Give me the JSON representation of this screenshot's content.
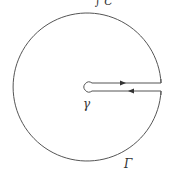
{
  "diagram": {
    "type": "keyhole-contour",
    "labels": {
      "top_partial": "∫ C",
      "inner_circle": "γ",
      "outer_circle": "Γ"
    },
    "geometry": {
      "center": [
        88,
        87
      ],
      "outer_radius": 74,
      "inner_radius": 4,
      "slit_upper_y": 83,
      "slit_lower_y": 91,
      "slit_right_x": 161
    },
    "colors": {
      "stroke": "#555555",
      "background": "#ffffff"
    },
    "arrows": [
      {
        "segment": "upper-slit",
        "direction": "right"
      },
      {
        "segment": "lower-slit",
        "direction": "left"
      }
    ]
  }
}
